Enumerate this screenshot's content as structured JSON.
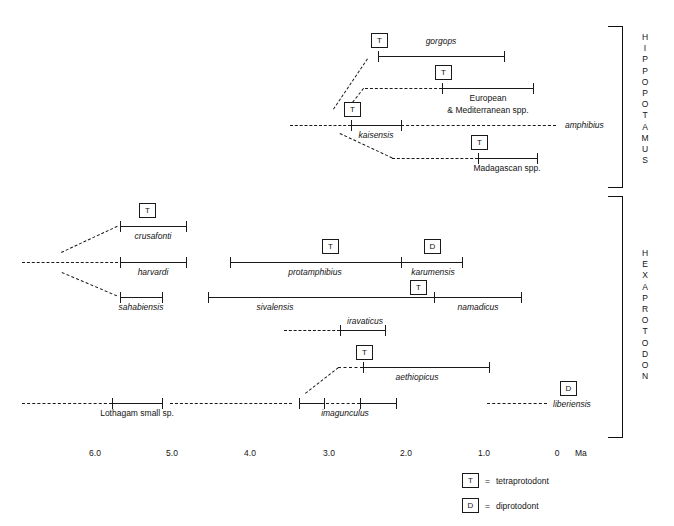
{
  "figure": {
    "type": "stratigraphic-range-chart",
    "axis": {
      "label": "Ma",
      "ticks": [
        "6.0",
        "5.0",
        "4.0",
        "3.0",
        "2.0",
        "1.0",
        "0"
      ],
      "tick_values": [
        6.0,
        5.0,
        4.0,
        3.0,
        2.0,
        1.0,
        0
      ],
      "direction": "older-left"
    },
    "clades": [
      {
        "name": "HIPPOPOTAMUS",
        "letters": [
          "H",
          "I",
          "P",
          "P",
          "O",
          "P",
          "O",
          "T",
          "A",
          "M",
          "U",
          "S"
        ]
      },
      {
        "name": "HEXAPROTODON",
        "letters": [
          "H",
          "E",
          "X",
          "A",
          "P",
          "R",
          "O",
          "T",
          "O",
          "D",
          "O",
          "N"
        ]
      }
    ],
    "legend": [
      {
        "symbol": "T",
        "eq": "=",
        "text": "tetraprotodont"
      },
      {
        "symbol": "D",
        "eq": "=",
        "text": "diprotodont"
      }
    ],
    "taxa": [
      {
        "id": "gorgops",
        "label": "gorgops",
        "italic": true,
        "clade": "HIPPOPOTAMUS",
        "marker": "T",
        "range_ma": [
          2.55,
          0.92
        ]
      },
      {
        "id": "euromed",
        "label": "European",
        "label2": "& Mediterranean spp.",
        "italic": false,
        "clade": "HIPPOPOTAMUS",
        "marker": "T",
        "range_ma": [
          1.72,
          0.34
        ]
      },
      {
        "id": "kaisensis",
        "label": "kaisensis",
        "italic": true,
        "clade": "HIPPOPOTAMUS",
        "marker": "T",
        "range_ma": [
          2.72,
          2.07
        ]
      },
      {
        "id": "amphibius",
        "label": "amphibius",
        "italic": true,
        "clade": "HIPPOPOTAMUS",
        "marker": null,
        "range_ma": null
      },
      {
        "id": "madagascan",
        "label": "Madagascan spp.",
        "italic": false,
        "clade": "HIPPOPOTAMUS",
        "marker": "T",
        "range_ma": [
          1.05,
          0.29
        ]
      },
      {
        "id": "crusafonti",
        "label": "crusafonti",
        "italic": true,
        "clade": "HEXAPROTODON",
        "marker": "T",
        "range_ma": [
          5.69,
          4.84
        ]
      },
      {
        "id": "harvardi",
        "label": "harvardi",
        "italic": true,
        "clade": "HEXAPROTODON",
        "marker": null,
        "range_ma": [
          5.69,
          4.84
        ]
      },
      {
        "id": "sahabiensis",
        "label": "sahabiensis",
        "italic": true,
        "clade": "HEXAPROTODON",
        "marker": null,
        "range_ma": [
          5.69,
          5.15
        ]
      },
      {
        "id": "protamphibius",
        "label": "protamphibius",
        "italic": true,
        "clade": "HEXAPROTODON",
        "marker": "T",
        "range_ma": [
          4.27,
          2.05
        ]
      },
      {
        "id": "karumensis",
        "label": "karumensis",
        "italic": true,
        "clade": "HEXAPROTODON",
        "marker": "D",
        "range_ma": [
          2.05,
          1.26
        ]
      },
      {
        "id": "sivalensis",
        "label": "sivalensis",
        "italic": true,
        "clade": "HEXAPROTODON",
        "marker": null,
        "range_ma": [
          4.55,
          1.62
        ]
      },
      {
        "id": "namadicus",
        "label": "namadicus",
        "italic": true,
        "clade": "HEXAPROTODON",
        "marker": "T",
        "range_ma": [
          1.62,
          0.48
        ]
      },
      {
        "id": "iravaticus",
        "label": "iravaticus",
        "italic": true,
        "clade": "HEXAPROTODON",
        "marker": null,
        "range_ma": [
          2.83,
          2.27
        ]
      },
      {
        "id": "aethiopicus",
        "label": "aethiopicus",
        "italic": true,
        "clade": "HEXAPROTODON",
        "marker": "T",
        "range_ma": [
          2.55,
          0.99
        ]
      },
      {
        "id": "lothagam",
        "label": "Lothagam small sp.",
        "italic": false,
        "clade": "HEXAPROTODON",
        "marker": null,
        "range_ma": [
          5.46,
          4.83
        ]
      },
      {
        "id": "imagunculus",
        "label": "imagunculus",
        "italic": true,
        "clade": "HEXAPROTODON",
        "marker": null,
        "range_ma": [
          3.03,
          2.28
        ]
      },
      {
        "id": "liberiensis",
        "label": "liberiensis",
        "italic": true,
        "clade": "HEXAPROTODON",
        "marker": "D",
        "range_ma": null
      }
    ]
  }
}
